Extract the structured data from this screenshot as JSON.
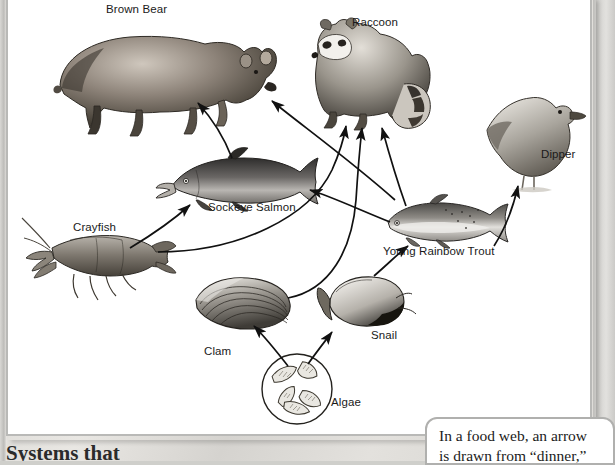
{
  "diagram": {
    "type": "food-web",
    "title": "Food Web",
    "organisms": [
      {
        "id": "brown-bear",
        "label": "Brown Bear",
        "label_x": 106,
        "label_y": 3,
        "trophic": "top predator"
      },
      {
        "id": "raccoon",
        "label": "Raccoon",
        "label_x": 352,
        "label_y": 16,
        "trophic": "predator"
      },
      {
        "id": "dipper",
        "label": "Dipper",
        "label_x": 541,
        "label_y": 148,
        "trophic": "predator"
      },
      {
        "id": "sockeye-salmon",
        "label": "Sockeye Salmon",
        "label_x": 208,
        "label_y": 200,
        "trophic": "consumer"
      },
      {
        "id": "young-rainbow-trout",
        "label": "Young Rainbow Trout",
        "label_x": 383,
        "label_y": 244,
        "trophic": "consumer"
      },
      {
        "id": "crayfish",
        "label": "Crayfish",
        "label_x": 73,
        "label_y": 221,
        "trophic": "consumer"
      },
      {
        "id": "clam",
        "label": "Clam",
        "label_x": 204,
        "label_y": 345,
        "trophic": "filter feeder"
      },
      {
        "id": "snail",
        "label": "Snail",
        "label_x": 371,
        "label_y": 329,
        "trophic": "grazer"
      },
      {
        "id": "algae",
        "label": "Algae",
        "label_x": 331,
        "label_y": 396,
        "trophic": "producer"
      }
    ],
    "arrows": [
      {
        "from": "sockeye-salmon",
        "to": "brown-bear"
      },
      {
        "from": "young-rainbow-trout",
        "to": "brown-bear"
      },
      {
        "from": "crayfish",
        "to": "sockeye-salmon"
      },
      {
        "from": "young-rainbow-trout",
        "to": "sockeye-salmon"
      },
      {
        "from": "crayfish",
        "to": "raccoon"
      },
      {
        "from": "clam",
        "to": "raccoon"
      },
      {
        "from": "young-rainbow-trout",
        "to": "raccoon"
      },
      {
        "from": "young-rainbow-trout",
        "to": "dipper"
      },
      {
        "from": "snail",
        "to": "young-rainbow-trout"
      },
      {
        "from": "algae",
        "to": "clam"
      },
      {
        "from": "algae",
        "to": "snail"
      }
    ]
  },
  "callout": {
    "line1": "In a food web, an arrow",
    "line2": "is drawn from “dinner,”"
  },
  "bottom_heading": "Systems that",
  "colors": {
    "panel_bg": "#ffffff",
    "panel_border": "#b9b9b7",
    "page_bg": "#dcdad6",
    "arrow": "#111111",
    "label_text": "#1a1a1a"
  }
}
